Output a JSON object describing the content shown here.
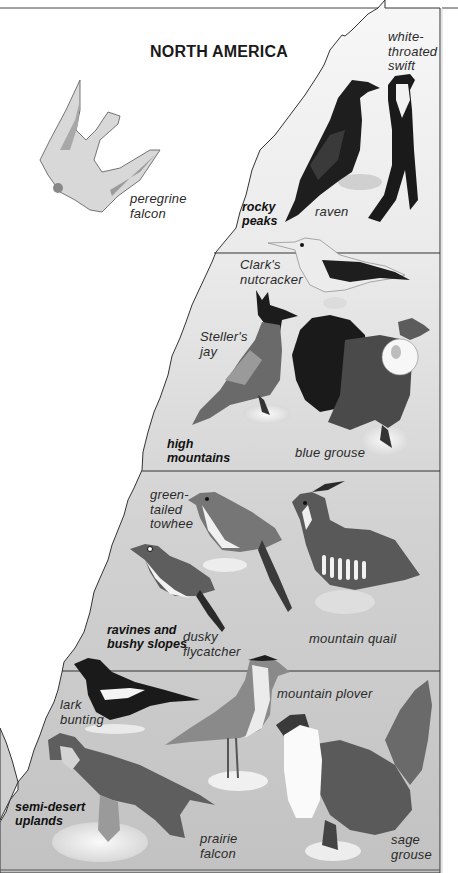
{
  "title": "NORTH AMERICA",
  "colors": {
    "background": "#ffffff",
    "mountain_top": "#f4f4f4",
    "mountain_bottom": "#c4c4c4",
    "outline": "#333333",
    "bird_dark": "#1c1c1c",
    "bird_mid": "#6e6e6e",
    "bird_light": "#e8e8e8"
  },
  "zones": [
    {
      "name": "rocky peaks",
      "label": "rocky\npeaks",
      "birds": [
        {
          "name": "raven",
          "label": "raven"
        },
        {
          "name": "white-throated swift",
          "label": "white-\nthroated\nswift"
        }
      ]
    },
    {
      "name": "high mountains",
      "label": "high\nmountains",
      "birds": [
        {
          "name": "Clark's nutcracker",
          "label": "Clark's\nnutcracker"
        },
        {
          "name": "Steller's jay",
          "label": "Steller's\njay"
        },
        {
          "name": "blue grouse",
          "label": "blue grouse"
        }
      ]
    },
    {
      "name": "ravines and bushy slopes",
      "label": "ravines and\nbushy slopes",
      "birds": [
        {
          "name": "green-tailed towhee",
          "label": "green-\ntailed\ntowhee"
        },
        {
          "name": "dusky flycatcher",
          "label": "dusky\nflycatcher"
        },
        {
          "name": "mountain quail",
          "label": "mountain quail"
        }
      ]
    },
    {
      "name": "semi-desert uplands",
      "label": "semi-desert\nuplands",
      "birds": [
        {
          "name": "lark bunting",
          "label": "lark\nbunting"
        },
        {
          "name": "mountain plover",
          "label": "mountain plover"
        },
        {
          "name": "prairie falcon",
          "label": "prairie\nfalcon"
        },
        {
          "name": "sage grouse",
          "label": "sage\ngrouse"
        }
      ]
    }
  ],
  "sky_birds": [
    {
      "name": "peregrine falcon",
      "label": "peregrine\nfalcon"
    }
  ]
}
